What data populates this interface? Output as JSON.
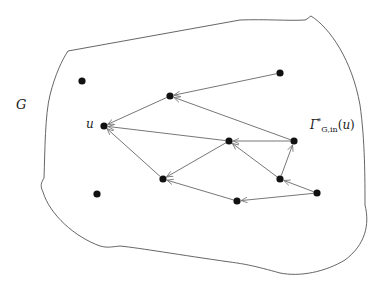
{
  "diagram": {
    "labels": {
      "graph": "G",
      "node_u": "u",
      "region_symbol": "Γ",
      "region_sup": "*",
      "region_sub": "G,in",
      "region_arg": "u"
    },
    "colors": {
      "boundary": "#555555",
      "edge": "#777777",
      "node": "#111111",
      "text": "#1a1a1a"
    },
    "boundary_path": "M 68 51 L 240 20 C 265 19 290 21 305 20 C 308 19 310 16 311 16 C 330 28 352 60 360 105 C 365 140 365 180 365 205 C 370 225 365 245 345 260 C 325 272 300 277 280 273 C 255 266 245 264 230 262 C 180 255 140 248 120 246 C 110 247 108 248 100 246 C 75 237 50 215 43 192 C 40 186 41 183 44 178 C 45 150 45 115 50 95 C 55 75 62 60 68 51 Z",
    "nodes": [
      {
        "id": "n_top",
        "x": 280,
        "y": 73
      },
      {
        "id": "n_a",
        "x": 170,
        "y": 96
      },
      {
        "id": "u",
        "x": 104,
        "y": 126
      },
      {
        "id": "n_mid",
        "x": 229,
        "y": 141
      },
      {
        "id": "n_right",
        "x": 294,
        "y": 141
      },
      {
        "id": "n_left_low",
        "x": 163,
        "y": 179
      },
      {
        "id": "n_rl",
        "x": 280,
        "y": 179
      },
      {
        "id": "n_far",
        "x": 317,
        "y": 193
      },
      {
        "id": "n_bot",
        "x": 237,
        "y": 201
      },
      {
        "id": "iso_1",
        "x": 82,
        "y": 81
      },
      {
        "id": "iso_2",
        "x": 97,
        "y": 194
      }
    ],
    "edges": [
      {
        "from": [
          280,
          73
        ],
        "to": [
          170,
          96
        ]
      },
      {
        "from": [
          294,
          141
        ],
        "to": [
          170,
          96
        ]
      },
      {
        "from": [
          170,
          96
        ],
        "to": [
          104,
          126
        ]
      },
      {
        "from": [
          229,
          141
        ],
        "to": [
          104,
          126
        ]
      },
      {
        "from": [
          163,
          179
        ],
        "to": [
          104,
          126
        ]
      },
      {
        "from": [
          294,
          141
        ],
        "to": [
          229,
          141
        ]
      },
      {
        "from": [
          229,
          141
        ],
        "to": [
          163,
          179
        ]
      },
      {
        "from": [
          280,
          179
        ],
        "to": [
          229,
          141
        ]
      },
      {
        "from": [
          280,
          179
        ],
        "to": [
          294,
          141
        ]
      },
      {
        "from": [
          317,
          193
        ],
        "to": [
          280,
          179
        ]
      },
      {
        "from": [
          317,
          193
        ],
        "to": [
          237,
          201
        ]
      },
      {
        "from": [
          237,
          201
        ],
        "to": [
          163,
          179
        ]
      }
    ]
  }
}
